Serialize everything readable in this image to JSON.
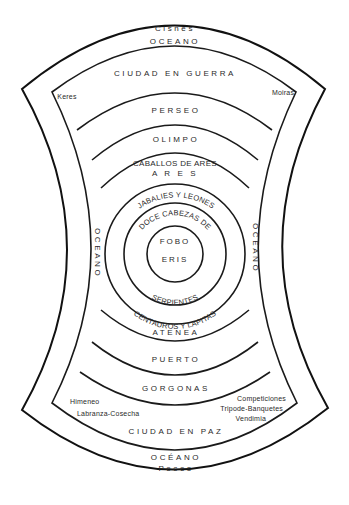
{
  "diagram": {
    "outer_ring": {
      "top_label": "Cisnes",
      "top_ocean": "OCEANO",
      "left_ocean": "OCEANO",
      "right_ocean": "OCEANO",
      "bottom_ocean": "OCÉANO",
      "bottom_label": "Peces"
    },
    "city_war": {
      "label": "CIUDAD EN GUERRA",
      "left_note": "Keres",
      "right_note": "Moiras"
    },
    "bands_top": [
      {
        "label": "PERSEO"
      },
      {
        "label": "OLIMPO"
      },
      {
        "label": "CABALLOS DE ARES",
        "sub": "A R E S"
      }
    ],
    "rings": {
      "ring1_top": "JABALIES Y LEONES",
      "ring1_bottom": "CENTAUROS Y LAPITAS",
      "ring2_top": "DOCE CABEZAS DE",
      "ring2_bottom": "SERPIENTES",
      "center_top": "FOBO",
      "center_bottom": "ERIS"
    },
    "bands_bottom": [
      {
        "label": "ATENEA"
      },
      {
        "label": "PUERTO"
      },
      {
        "label": "GORGONAS"
      }
    ],
    "city_peace": {
      "label": "CIUDAD EN PAZ",
      "left_notes": [
        "Himeneo",
        "Labranza-Cosecha"
      ],
      "right_notes": [
        "Competiciones",
        "Tripode-Banquetes",
        "Vendimia"
      ]
    }
  }
}
